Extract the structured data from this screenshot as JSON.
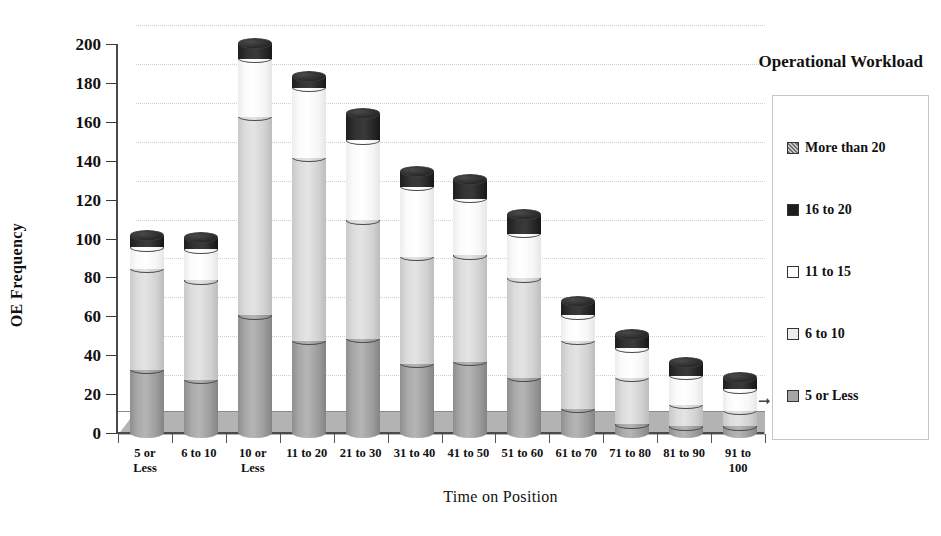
{
  "chart_data": {
    "type": "bar",
    "subtype": "stacked-cylinder-3d",
    "title": "",
    "xlabel": "Time on Position",
    "ylabel": "OE Frequency",
    "ylim": [
      0,
      200
    ],
    "yticks": [
      0,
      20,
      40,
      60,
      80,
      100,
      120,
      140,
      160,
      180,
      200
    ],
    "grid": true,
    "legend_title": "Operational Workload",
    "legend_position": "right",
    "categories": [
      "5 or Less",
      "6 to 10",
      "10 or Less",
      "11 to 20",
      "21 to 30",
      "31 to 40",
      "41 to 50",
      "51 to 60",
      "61 to 70",
      "71 to 80",
      "81 to 90",
      "91 to 100"
    ],
    "categories_display": [
      [
        "5 or",
        "Less"
      ],
      [
        "6 to 10",
        ""
      ],
      [
        "10 or",
        "Less"
      ],
      [
        "11 to 20",
        ""
      ],
      [
        "21 to 30",
        ""
      ],
      [
        "31 to 40",
        ""
      ],
      [
        "41 to 50",
        ""
      ],
      [
        "51 to 60",
        ""
      ],
      [
        "61 to 70",
        ""
      ],
      [
        "71 to 80",
        ""
      ],
      [
        "81 to 90",
        ""
      ],
      [
        "91 to",
        "100"
      ]
    ],
    "series": [
      {
        "name": "5 or Less",
        "swatch": "sw-dark",
        "fill": "c-dark",
        "cap": "cap-dark",
        "values": [
          32,
          27,
          60,
          47,
          48,
          35,
          36,
          28,
          12,
          4,
          3,
          3
        ]
      },
      {
        "name": "6 to 10",
        "swatch": "sw-vlight",
        "fill": "c-light",
        "cap": "cap-light",
        "values": [
          52,
          51,
          102,
          94,
          61,
          55,
          55,
          51,
          35,
          24,
          11,
          8
        ]
      },
      {
        "name": "11 to 15",
        "swatch": "sw-white",
        "fill": "c-white",
        "cap": "cap-white",
        "values": [
          11,
          16,
          30,
          36,
          41,
          36,
          29,
          23,
          13,
          15,
          15,
          11
        ]
      },
      {
        "name": "16 to 20",
        "swatch": "sw-black",
        "fill": "c-black",
        "cap": "cap-black",
        "values": [
          6,
          6,
          8,
          6,
          14,
          8,
          10,
          10,
          7,
          7,
          7,
          6
        ]
      },
      {
        "name": "More than 20",
        "swatch": "sw-hatch",
        "fill": "c-hatch",
        "cap": "cap-hatch",
        "values": [
          0,
          0,
          0,
          0,
          0,
          0,
          0,
          0,
          0,
          0,
          0,
          0
        ]
      }
    ],
    "totals": [
      101,
      100,
      200,
      183,
      164,
      134,
      130,
      112,
      67,
      50,
      36,
      28
    ]
  },
  "legend": {
    "title": "Operational Workload",
    "items": [
      {
        "label": "More than 20",
        "swatch": "sw-hatch"
      },
      {
        "label": "16 to 20",
        "swatch": "sw-black"
      },
      {
        "label": "11 to 15",
        "swatch": "sw-white"
      },
      {
        "label": "6 to 10",
        "swatch": "sw-vlight"
      },
      {
        "label": "5 or Less",
        "swatch": "sw-dark"
      }
    ]
  },
  "axes": {
    "y_title": "OE Frequency",
    "x_title": "Time on Position"
  },
  "colors": {
    "series_5_or_less": "#a6a6a6",
    "series_6_to_10": "#dcdcdc",
    "series_11_to_15": "#ffffff",
    "series_16_to_20": "#1d1d1d",
    "series_more_than_20": "#8b8b8b",
    "axis": "#4a4a4a",
    "grid": "#cfcfcf",
    "floor": "#b3b3b3"
  }
}
